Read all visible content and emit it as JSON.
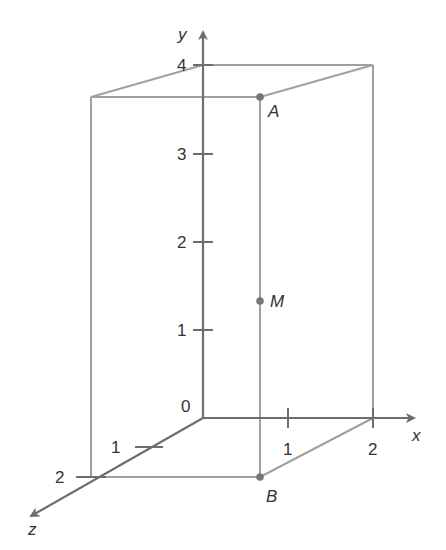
{
  "diagram": {
    "type": "3d-coordinate-box",
    "colors": {
      "axis": "#6e6e6e",
      "edge": "#a0a0a0",
      "point": "#777777",
      "text": "#333333",
      "background": "#ffffff"
    },
    "axes": {
      "x": {
        "label": "x",
        "ticks": [
          "1",
          "2"
        ]
      },
      "y": {
        "label": "y",
        "ticks": [
          "1",
          "2",
          "3",
          "4"
        ]
      },
      "z": {
        "label": "z",
        "ticks": [
          "1",
          "2"
        ]
      },
      "origin_label": "0"
    },
    "points": {
      "A": {
        "label": "A"
      },
      "M": {
        "label": "M"
      },
      "B": {
        "label": "B"
      }
    }
  }
}
